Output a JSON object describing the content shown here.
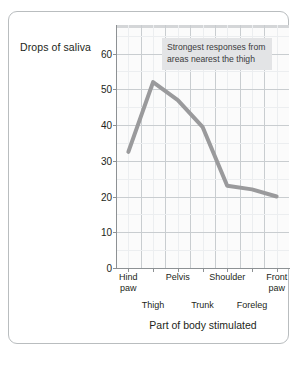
{
  "chart_data": {
    "type": "line",
    "title": "",
    "ylabel": "Drops of saliva",
    "xlabel": "Part of body stimulated",
    "ylim": [
      0,
      68
    ],
    "ytick_labels": [
      "0",
      "10",
      "20",
      "30",
      "40",
      "50",
      "60"
    ],
    "ytick_values": [
      0,
      10,
      20,
      30,
      40,
      50,
      60
    ],
    "grid": true,
    "legend": "none",
    "categories": [
      "Hind paw",
      "Thigh",
      "Pelvis",
      "Trunk",
      "Shoulder",
      "Foreleg",
      "Front paw"
    ],
    "categories_upper": [
      "Hind\npaw",
      "Pelvis",
      "Shoulder",
      "Front\npaw"
    ],
    "categories_lower": [
      "Thigh",
      "Trunk",
      "Foreleg"
    ],
    "values": [
      32.5,
      52,
      47,
      39.5,
      23,
      22,
      20
    ],
    "series": [
      {
        "name": "Drops of saliva",
        "values": [
          32.5,
          52,
          47,
          39.5,
          23,
          22,
          20
        ],
        "color": "#9a9a9c"
      }
    ],
    "annotations": [
      {
        "text": "Strongest responses from areas nearest the thigh",
        "background": "#e3e4e6"
      }
    ]
  },
  "colors": {
    "line": "#9a9a9c",
    "grid_major": "#c9cdd0",
    "grid_minor": "#eceef0",
    "axis": "#8d9194",
    "frame": "#b9bdbf",
    "plot_bg": "#fbfbfb",
    "annotation_bg": "#e3e4e6",
    "text": "#231f20"
  },
  "annotation_text": "Strongest responses from areas nearest the thigh"
}
